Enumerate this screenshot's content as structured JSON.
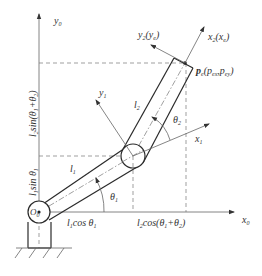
{
  "diagram": {
    "frames": {
      "base_x": {
        "main": "x",
        "sub": "0"
      },
      "base_y": {
        "main": "y",
        "sub": "0"
      },
      "link1_x": {
        "main": "x",
        "sub": "1"
      },
      "link1_y": {
        "main": "y",
        "sub": "1"
      },
      "link2_x": {
        "main": "x",
        "sub": "2",
        "paren_main": "x",
        "paren_sub": "e"
      },
      "link2_y": {
        "main": "y",
        "sub": "2",
        "paren_main": "y",
        "paren_sub": "e"
      }
    },
    "origin": {
      "main": "O",
      "sub": "0"
    },
    "end_point": {
      "main": "p",
      "sub": "e",
      "coords": "(p",
      "c1_sub": "ex",
      "sep": ",p",
      "c2_sub": "ey",
      "close": ")"
    },
    "links": {
      "l1": {
        "main": "l",
        "sub": "1"
      },
      "l2": {
        "main": "l",
        "sub": "2"
      }
    },
    "angles": {
      "theta1": {
        "main": "θ",
        "sub": "1",
        "degrees": 30
      },
      "theta2": {
        "main": "θ",
        "sub": "2",
        "degrees": 30
      }
    },
    "projections": {
      "x1": {
        "text": "l",
        "sub1": "1",
        "rest": "cos θ",
        "sub2": "1"
      },
      "x2": {
        "text": "l",
        "sub1": "2",
        "rest": "cos(θ",
        "sub2": "1",
        "plus": "+θ",
        "sub3": "2",
        "close": ")"
      },
      "y1": {
        "text": "l",
        "sub1": "1",
        "rest": "sin θ",
        "sub2": "1"
      },
      "y2": {
        "text": "l",
        "sub1": "2",
        "rest": "sin(θ",
        "sub2": "1",
        "plus": "+θ",
        "sub3": "2",
        "close": ")"
      }
    }
  }
}
